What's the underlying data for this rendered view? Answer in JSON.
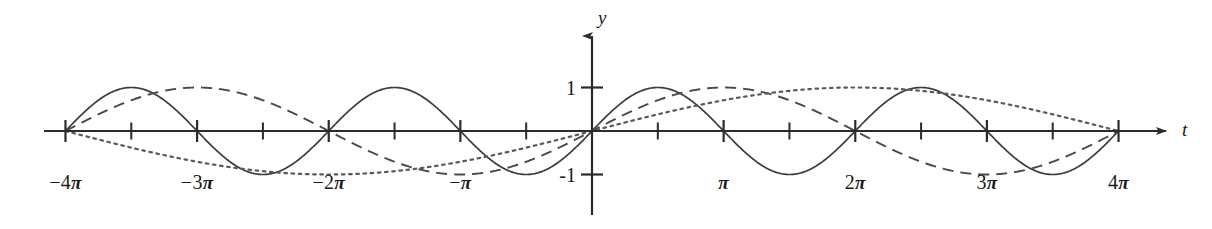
{
  "figure": {
    "title": "",
    "background": "#ffffff",
    "ink_color": "#2b2b2b"
  },
  "axes": {
    "x_axis_label": "t",
    "y_axis_label": "y",
    "x_tick_labels": [
      {
        "text_num": "−4",
        "text_pi": "π",
        "value": -12.566
      },
      {
        "text_num": "−3",
        "text_pi": "π",
        "value": -9.425
      },
      {
        "text_num": "−2",
        "text_pi": "π",
        "value": -6.283
      },
      {
        "text_num": "−",
        "text_pi": "π",
        "value": -3.142
      },
      {
        "text_num": "",
        "text_pi": "π",
        "value": 3.142
      },
      {
        "text_num": "2",
        "text_pi": "π",
        "value": 6.283
      },
      {
        "text_num": "3",
        "text_pi": "π",
        "value": 9.425
      },
      {
        "text_num": "4",
        "text_pi": "π",
        "value": 12.566
      }
    ],
    "y_tick_labels": [
      {
        "text": "1",
        "value": 1
      },
      {
        "text": "-1",
        "value": -1
      }
    ],
    "x_minor_tick_step_pi": 0.5,
    "xlim": [
      -13.6,
      13.3
    ],
    "ylim": [
      -1.45,
      1.95
    ],
    "grid": false,
    "arrow_heads": [
      "x-positive",
      "y-positive"
    ]
  },
  "chart_data": {
    "type": "line",
    "title": "",
    "xlabel": "t",
    "ylabel": "y",
    "xlim": [
      -13.6,
      13.3
    ],
    "ylim": [
      -1.45,
      1.95
    ],
    "grid": false,
    "legend": "none",
    "x_tick_values": [
      -12.566,
      -9.425,
      -6.283,
      -3.142,
      3.142,
      6.283,
      9.425,
      12.566
    ],
    "x_tick_text": [
      "-4π",
      "-3π",
      "-2π",
      "-π",
      "π",
      "2π",
      "3π",
      "4π"
    ],
    "y_tick_values": [
      1,
      -1
    ],
    "y_tick_text": [
      "1",
      "-1"
    ],
    "series": [
      {
        "name": "sin(t)",
        "style": "solid",
        "amplitude": 1,
        "period": 6.2832,
        "phase": 0,
        "color": "#3c3c3c",
        "domain": [
          -12.566,
          12.566
        ]
      },
      {
        "name": "sin(t/2)",
        "style": "dashed",
        "amplitude": 1,
        "period": 12.566,
        "phase": 0,
        "color": "#4a4a4a",
        "domain": [
          -12.566,
          12.566
        ]
      },
      {
        "name": "sin(t/4)",
        "style": "dotted",
        "amplitude": 1,
        "period": 25.133,
        "phase": 0,
        "color": "#5a5a5a",
        "domain": [
          -12.566,
          12.566
        ]
      }
    ]
  },
  "geometry": {
    "origin_x": 592,
    "origin_y": 131,
    "px_per_unit_x": 41.9,
    "px_per_unit_y": 43.5,
    "x_axis_start": 44,
    "x_axis_end": 1166,
    "y_axis_top": 36,
    "y_axis_bottom": 215,
    "tick_half_height": 11
  }
}
